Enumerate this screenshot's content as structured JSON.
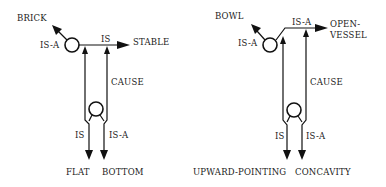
{
  "diagrams": [
    {
      "name": "brick-stable",
      "labels": {
        "top_target": "BRICK",
        "top_rel": "IS-A",
        "right_rel": "IS",
        "right_target": "STABLE",
        "cause": "CAUSE",
        "bottom_left_rel": "IS",
        "bottom_right_rel": "IS-A",
        "bottom_left_target": "FLAT",
        "bottom_right_target": "BOTTOM"
      }
    },
    {
      "name": "bowl-open-vessel",
      "labels": {
        "top_target": "BOWL",
        "top_rel": "IS-A",
        "right_rel": "IS-A",
        "right_target_line1": "OPEN-",
        "right_target_line2": "VESSEL",
        "cause": "CAUSE",
        "bottom_left_rel": "IS",
        "bottom_right_rel": "IS-A",
        "bottom_left_target": "UPWARD-POINTING",
        "bottom_right_target": "CONCAVITY"
      }
    }
  ]
}
